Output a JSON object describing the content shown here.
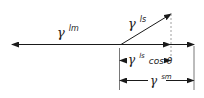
{
  "diagram": {
    "type": "vector-force-balance",
    "colors": {
      "stroke": "#1a1a1a",
      "dashed": "#888888",
      "background": "#ffffff"
    },
    "labels": {
      "lm": {
        "symbol": "γ",
        "sup": "lm"
      },
      "ls": {
        "symbol": "γ",
        "sup": "ls"
      },
      "ls_cos": {
        "symbol": "γ",
        "sup": "ls",
        "suffix": "cos θ"
      },
      "sm": {
        "symbol": "γ",
        "sup": "sm"
      }
    }
  }
}
